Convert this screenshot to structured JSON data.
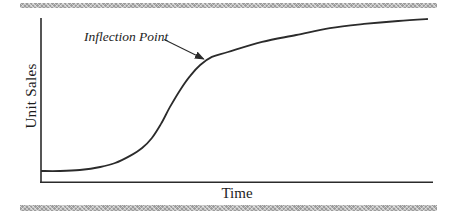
{
  "figure": {
    "background": "#ffffff",
    "rule_color": "#9c9c9c",
    "line_color": "#2b2b2b",
    "text_color": "#1d1d1d"
  },
  "chart_data": {
    "type": "line",
    "title": "",
    "xlabel": "Time",
    "ylabel": "Unit Sales",
    "x_range": [
      0,
      100
    ],
    "y_range": [
      0,
      100
    ],
    "grid": false,
    "tick_labels": "none",
    "legend": "none",
    "series": [
      {
        "name": "unit-sales-s-curve",
        "points": [
          [
            0,
            7.3
          ],
          [
            4.8,
            7.3
          ],
          [
            9.9,
            7.9
          ],
          [
            15.1,
            9.7
          ],
          [
            18.9,
            12.1
          ],
          [
            22.7,
            16.4
          ],
          [
            25.8,
            21.2
          ],
          [
            28.3,
            27.3
          ],
          [
            30.6,
            35.8
          ],
          [
            32.9,
            46.1
          ],
          [
            35.5,
            56.4
          ],
          [
            38.0,
            64.8
          ],
          [
            40.6,
            71.5
          ],
          [
            43.6,
            76.4
          ],
          [
            47.7,
            79.4
          ],
          [
            56.4,
            85.5
          ],
          [
            65.1,
            89.7
          ],
          [
            73.7,
            93.9
          ],
          [
            82.4,
            96.4
          ],
          [
            91.1,
            98.2
          ],
          [
            98.7,
            99.4
          ]
        ]
      }
    ],
    "annotations": [
      {
        "label": "Inflection Point",
        "arrow_from": [
          31.4,
          87.0
        ],
        "arrow_to": [
          41.5,
          75.2
        ]
      }
    ]
  }
}
